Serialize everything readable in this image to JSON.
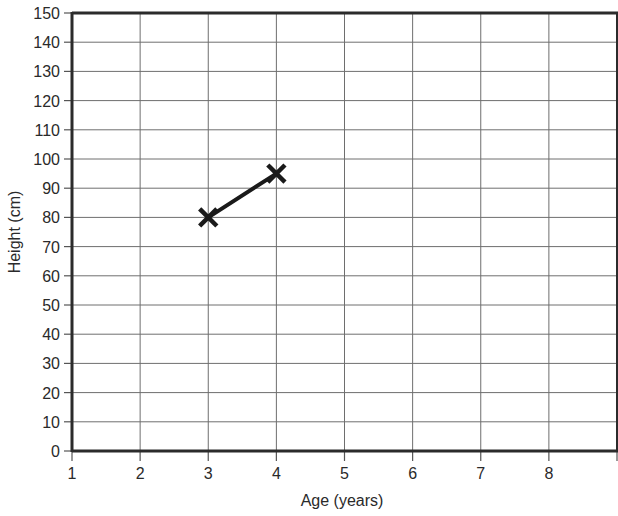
{
  "chart_data": {
    "type": "line",
    "title": "",
    "xlabel": "Age (years)",
    "ylabel": "Height (cm)",
    "x_ticks": [
      "1",
      "2",
      "3",
      "4",
      "5",
      "6",
      "7",
      "8"
    ],
    "y_ticks": [
      "0",
      "10",
      "20",
      "30",
      "40",
      "50",
      "60",
      "70",
      "80",
      "90",
      "100",
      "110",
      "120",
      "130",
      "140",
      "150"
    ],
    "xlim": [
      1,
      9
    ],
    "ylim": [
      0,
      150
    ],
    "grid": true,
    "legend": null,
    "series": [
      {
        "name": "Height",
        "marker": "x",
        "x": [
          3,
          4
        ],
        "values": [
          80,
          95
        ]
      }
    ]
  }
}
